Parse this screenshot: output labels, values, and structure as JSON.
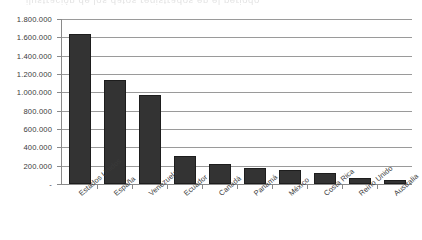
{
  "artifact": {
    "bleed_text": "ilustración  de  los  datos  registrados  en  el  periodo"
  },
  "chart_data": {
    "type": "bar",
    "title": "",
    "subtitle": "",
    "xlabel": "",
    "ylabel": "",
    "categories": [
      "Estados Unidos",
      "España",
      "Venezuela",
      "Ecuador",
      "Canadá",
      "Panamá",
      "México",
      "Costa Rica",
      "Reino Unido",
      "Australia"
    ],
    "values": [
      1640000,
      1135000,
      970000,
      305000,
      215000,
      170000,
      155000,
      120000,
      70000,
      45000
    ],
    "ylim": [
      0,
      1800000
    ],
    "ytick_values": [
      0,
      200000,
      400000,
      600000,
      800000,
      1000000,
      1200000,
      1400000,
      1600000,
      1800000
    ],
    "ytick_labels": [
      "-",
      "200.000",
      "400.000",
      "600.000",
      "800.000",
      "1.000.000",
      "1.200.000",
      "1.400.000",
      "1.600.000",
      "1.800.000"
    ],
    "grid": true,
    "legend": false,
    "legend_position": "none",
    "bar_color": "#333333",
    "gridline_color": "#9a9a9a",
    "axis_color": "#8a8a8a",
    "background_color": "#ffffff",
    "number_format": "european-dot-thousands",
    "xtick_label_rotation": -41
  }
}
